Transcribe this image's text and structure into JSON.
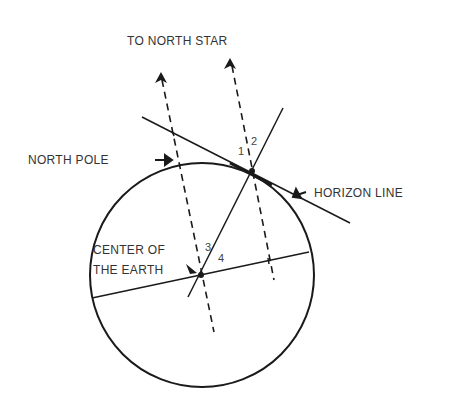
{
  "diagram": {
    "labels": {
      "north_star": "TO NORTH STAR",
      "north_pole": "NORTH POLE",
      "horizon_line": "HORIZON LINE",
      "center_line1": "CENTER OF",
      "center_line2": "THE EARTH"
    },
    "angles": {
      "a1": "1",
      "a2": "2",
      "a3": "3",
      "a4": "4"
    },
    "colors": {
      "ink": "#1a1a1a",
      "text": "#333333",
      "background": "#ffffff"
    }
  }
}
